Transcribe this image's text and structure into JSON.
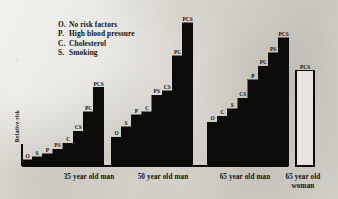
{
  "figure": {
    "y_axis_label": "Relative risk",
    "legend_items": [
      {
        "key": "O.",
        "label": "No risk factors"
      },
      {
        "key": "P.",
        "label": "High blood pressure"
      },
      {
        "key": "C.",
        "label": "Cholesterol"
      },
      {
        "key": "S.",
        "label": "Smoking"
      }
    ],
    "group_captions": [
      "35 year old man",
      "50 year old man",
      "65 year old man",
      "65 year old\nwoman"
    ]
  },
  "colors": {
    "bar_fill": "#0d0b09",
    "bar_outline": "#0d0b09",
    "hollow_fill": "#e7e4dd",
    "text": "#14120f",
    "paper": "#d9d6cf"
  },
  "chart_data": {
    "type": "bar",
    "title": "",
    "xlabel": "",
    "ylabel": "Relative risk",
    "grid": false,
    "legend_position": "top-left",
    "ylim": [
      0,
      100
    ],
    "categories": [
      "35 year old man",
      "50 year old man",
      "65 year old man",
      "65 year old woman"
    ],
    "groups": [
      {
        "name": "35 year old man",
        "style": "filled",
        "bars": [
          {
            "label": "O",
            "value": 4
          },
          {
            "label": "S",
            "value": 6
          },
          {
            "label": "P",
            "value": 8
          },
          {
            "label": "PS",
            "value": 11
          },
          {
            "label": "C",
            "value": 15
          },
          {
            "label": "CS",
            "value": 23
          },
          {
            "label": "PC",
            "value": 36
          },
          {
            "label": "PCS",
            "value": 52
          }
        ]
      },
      {
        "name": "50 year old man",
        "style": "filled",
        "bars": [
          {
            "label": "O",
            "value": 19
          },
          {
            "label": "S",
            "value": 26
          },
          {
            "label": "P",
            "value": 34
          },
          {
            "label": "C",
            "value": 36
          },
          {
            "label": "PS",
            "value": 47
          },
          {
            "label": "CS",
            "value": 50
          },
          {
            "label": "PC",
            "value": 73
          },
          {
            "label": "PCS",
            "value": 95
          }
        ]
      },
      {
        "name": "65 year old man",
        "style": "filled",
        "bars": [
          {
            "label": "O",
            "value": 29
          },
          {
            "label": "C",
            "value": 33
          },
          {
            "label": "S",
            "value": 38
          },
          {
            "label": "CS",
            "value": 45
          },
          {
            "label": "P",
            "value": 57
          },
          {
            "label": "PC",
            "value": 66
          },
          {
            "label": "PS",
            "value": 75
          },
          {
            "label": "PCS",
            "value": 85
          }
        ]
      },
      {
        "name": "65 year old woman",
        "style": "hollow",
        "bars": [
          {
            "label": "PCS",
            "value": 63
          }
        ]
      }
    ]
  }
}
